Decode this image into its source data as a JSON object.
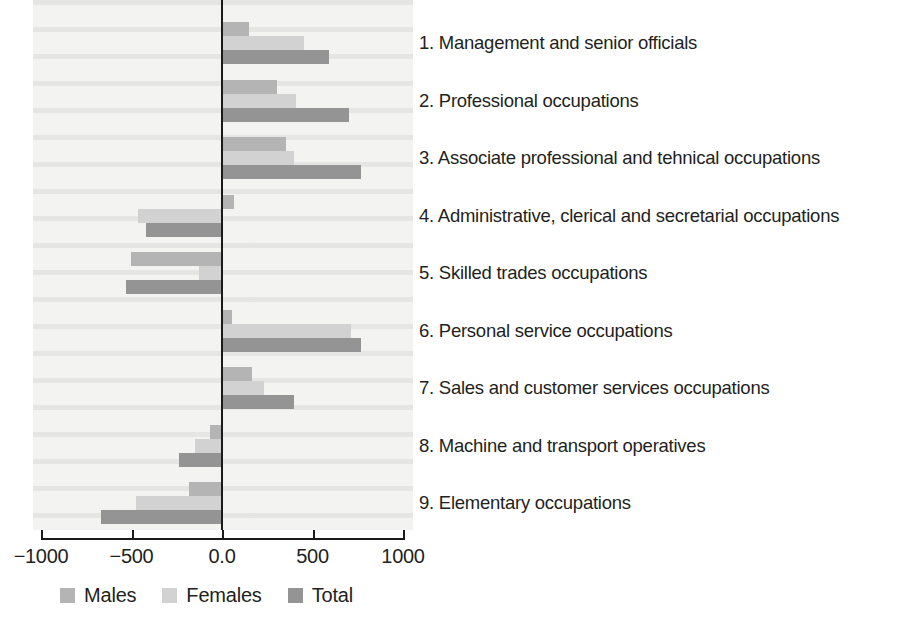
{
  "chart_data": {
    "type": "bar",
    "orientation": "horizontal",
    "title": "",
    "xlabel": "",
    "ylabel": "",
    "xlim": [
      -1000,
      1000
    ],
    "xticks": [
      "-1000",
      "-500",
      "0.0",
      "500",
      "1000"
    ],
    "xtick_values": [
      -1000,
      -500,
      0,
      500,
      1000
    ],
    "grid": false,
    "legend_position": "bottom",
    "categories": [
      "1. Management and senior officials",
      "2. Professional occupations",
      "3. Associate professional and tehnical occupations",
      "4. Administrative, clerical and secretarial occupations",
      "5. Skilled trades occupations",
      "6. Personal service occupations",
      "7. Sales and customer services occupations",
      "8. Machine and transport operatives",
      "9. Elementary occupations"
    ],
    "series": [
      {
        "name": "Males",
        "color": "#b4b4b4",
        "values": [
          155,
          310,
          360,
          70,
          -497,
          60,
          171,
          -60,
          -176
        ]
      },
      {
        "name": "Females",
        "color": "#d2d2d2",
        "values": [
          458,
          415,
          405,
          -458,
          -120,
          718,
          238,
          -143,
          -469
        ]
      },
      {
        "name": "Total",
        "color": "#949494",
        "values": [
          597,
          708,
          775,
          -414,
          -525,
          773,
          403,
          -232,
          -663
        ]
      }
    ]
  },
  "legend": {
    "items": [
      {
        "label": "Males",
        "color": "#b4b4b4"
      },
      {
        "label": "Females",
        "color": "#d2d2d2"
      },
      {
        "label": "Total",
        "color": "#949494"
      }
    ]
  },
  "category_key": {
    "items": [
      "1. Management and senior officials",
      "2. Professional occupations",
      "3. Associate professional and tehnical occupations",
      "4. Administrative, clerical and secretarial occupations",
      "5. Skilled trades occupations",
      "6. Personal service occupations",
      "7. Sales and customer services occupations",
      "8. Machine and transport operatives",
      "9. Elementary occupations"
    ]
  },
  "axis": {
    "tick_labels": [
      "-1000",
      "-500",
      "0.0",
      "500",
      "1000"
    ]
  }
}
